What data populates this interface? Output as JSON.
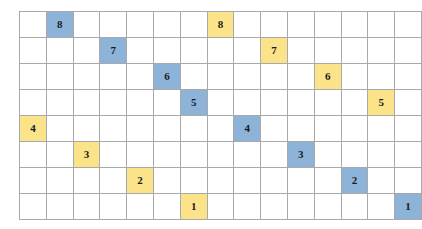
{
  "grid": {
    "rows": 8,
    "cols": 15,
    "cell_width": 26,
    "cell_height": 25,
    "border_color": "#a9a9a9",
    "empty_color": "#ffffff",
    "blue_color": "#8db4d8",
    "yellow_color": "#fbe38a",
    "text_color": "#1a1a1a"
  },
  "cells": [
    {
      "row": 0,
      "col": 1,
      "value": "8",
      "fill": "blue"
    },
    {
      "row": 0,
      "col": 7,
      "value": "8",
      "fill": "yellow"
    },
    {
      "row": 1,
      "col": 3,
      "value": "7",
      "fill": "blue"
    },
    {
      "row": 1,
      "col": 9,
      "value": "7",
      "fill": "yellow"
    },
    {
      "row": 2,
      "col": 5,
      "value": "6",
      "fill": "blue"
    },
    {
      "row": 2,
      "col": 11,
      "value": "6",
      "fill": "yellow"
    },
    {
      "row": 3,
      "col": 6,
      "value": "5",
      "fill": "blue"
    },
    {
      "row": 3,
      "col": 13,
      "value": "5",
      "fill": "yellow"
    },
    {
      "row": 4,
      "col": 0,
      "value": "4",
      "fill": "yellow"
    },
    {
      "row": 4,
      "col": 8,
      "value": "4",
      "fill": "blue"
    },
    {
      "row": 5,
      "col": 2,
      "value": "3",
      "fill": "yellow"
    },
    {
      "row": 5,
      "col": 10,
      "value": "3",
      "fill": "blue"
    },
    {
      "row": 6,
      "col": 4,
      "value": "2",
      "fill": "yellow"
    },
    {
      "row": 6,
      "col": 12,
      "value": "2",
      "fill": "blue"
    },
    {
      "row": 7,
      "col": 6,
      "value": "1",
      "fill": "yellow"
    },
    {
      "row": 7,
      "col": 14,
      "value": "1",
      "fill": "blue"
    }
  ]
}
